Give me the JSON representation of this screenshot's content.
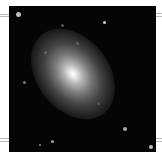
{
  "image": {
    "subject": "elliptical galaxy",
    "description": "Grayscale astronomical image of an elliptical galaxy centered on a black sky field with scattered faint stars",
    "colors": {
      "background": "#ffffff",
      "sky": "#050505",
      "core": "#ffffff",
      "rule": "#b8b8b8"
    }
  }
}
